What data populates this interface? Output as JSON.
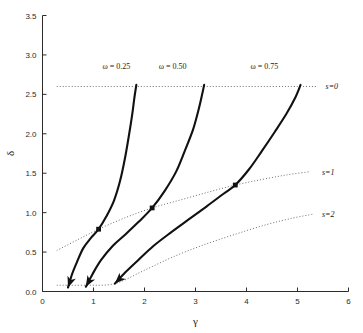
{
  "chart_data": {
    "type": "line",
    "title": "",
    "xlabel": "γ",
    "ylabel": "δ",
    "xlim": [
      0,
      6
    ],
    "ylim": [
      0.0,
      3.5
    ],
    "grid": false,
    "legend_position": "inline-annotations",
    "xticks": [
      "0",
      "1",
      "2",
      "3",
      "4",
      "5",
      "6"
    ],
    "xtick_values": [
      0,
      1,
      2,
      3,
      4,
      5,
      6
    ],
    "yticks": [
      "0.0",
      "0.5",
      "1.0",
      "1.5",
      "2.0",
      "2.5",
      "3.0",
      "3.5"
    ],
    "ytick_values": [
      0.0,
      0.5,
      1.0,
      1.5,
      2.0,
      2.5,
      3.0,
      3.5
    ],
    "series": [
      {
        "name": "ω = 0.25",
        "label": "ω = 0.25",
        "style": "solid",
        "label_x": 1.45,
        "label_y": 2.86,
        "arrow_tip": [
          0.5,
          0.05
        ],
        "marker_point": [
          1.1,
          0.79
        ],
        "x": [
          0.5,
          0.58,
          0.68,
          0.8,
          0.95,
          1.1,
          1.25,
          1.4,
          1.52,
          1.62,
          1.7,
          1.76,
          1.8,
          1.84
        ],
        "y": [
          0.05,
          0.22,
          0.38,
          0.55,
          0.68,
          0.79,
          0.95,
          1.15,
          1.4,
          1.7,
          2.0,
          2.25,
          2.45,
          2.62
        ]
      },
      {
        "name": "ω = 0.50",
        "label": "ω = 0.50",
        "style": "solid",
        "label_x": 2.55,
        "label_y": 2.86,
        "arrow_tip": [
          0.85,
          0.06
        ],
        "marker_point": [
          2.15,
          1.06
        ],
        "x": [
          0.85,
          0.98,
          1.15,
          1.38,
          1.62,
          1.88,
          2.15,
          2.4,
          2.62,
          2.8,
          2.95,
          3.05,
          3.12,
          3.17
        ],
        "y": [
          0.06,
          0.22,
          0.4,
          0.58,
          0.72,
          0.88,
          1.06,
          1.28,
          1.52,
          1.8,
          2.05,
          2.28,
          2.47,
          2.62
        ]
      },
      {
        "name": "ω = 0.75",
        "label": "ω = 0.75",
        "style": "solid",
        "label_x": 4.35,
        "label_y": 2.86,
        "arrow_tip": [
          1.42,
          0.1
        ],
        "marker_point": [
          3.78,
          1.35
        ],
        "x": [
          1.42,
          1.62,
          1.88,
          2.18,
          2.52,
          2.88,
          3.22,
          3.55,
          3.78,
          4.05,
          4.3,
          4.55,
          4.78,
          4.95,
          5.06
        ],
        "y": [
          0.1,
          0.24,
          0.4,
          0.58,
          0.75,
          0.92,
          1.08,
          1.24,
          1.35,
          1.55,
          1.78,
          2.02,
          2.25,
          2.45,
          2.62
        ]
      }
    ],
    "level_curves": [
      {
        "name": "s=0",
        "label": "s=0",
        "style": "dotted",
        "label_x": 5.55,
        "label_y": 2.6,
        "x": [
          0.28,
          1.0,
          2.0,
          3.0,
          4.0,
          5.0,
          5.4
        ],
        "y": [
          2.6,
          2.6,
          2.6,
          2.6,
          2.6,
          2.6,
          2.6
        ]
      },
      {
        "name": "s=1",
        "label": "s=1",
        "style": "dotted",
        "label_x": 5.48,
        "label_y": 1.52,
        "x": [
          0.28,
          0.7,
          1.1,
          1.6,
          2.15,
          2.7,
          3.25,
          3.78,
          4.3,
          4.8,
          5.25
        ],
        "y": [
          0.52,
          0.66,
          0.79,
          0.93,
          1.06,
          1.16,
          1.26,
          1.35,
          1.42,
          1.48,
          1.52
        ]
      },
      {
        "name": "s=2",
        "label": "s=2",
        "style": "dotted",
        "label_x": 5.48,
        "label_y": 0.98,
        "x": [
          0.28,
          0.85,
          1.42,
          2.0,
          2.6,
          3.2,
          3.8,
          4.4,
          4.9,
          5.3
        ],
        "y": [
          0.08,
          0.08,
          0.1,
          0.27,
          0.45,
          0.6,
          0.73,
          0.85,
          0.93,
          0.98
        ]
      }
    ]
  },
  "axes": {
    "x_title": "γ",
    "y_title": "δ"
  }
}
